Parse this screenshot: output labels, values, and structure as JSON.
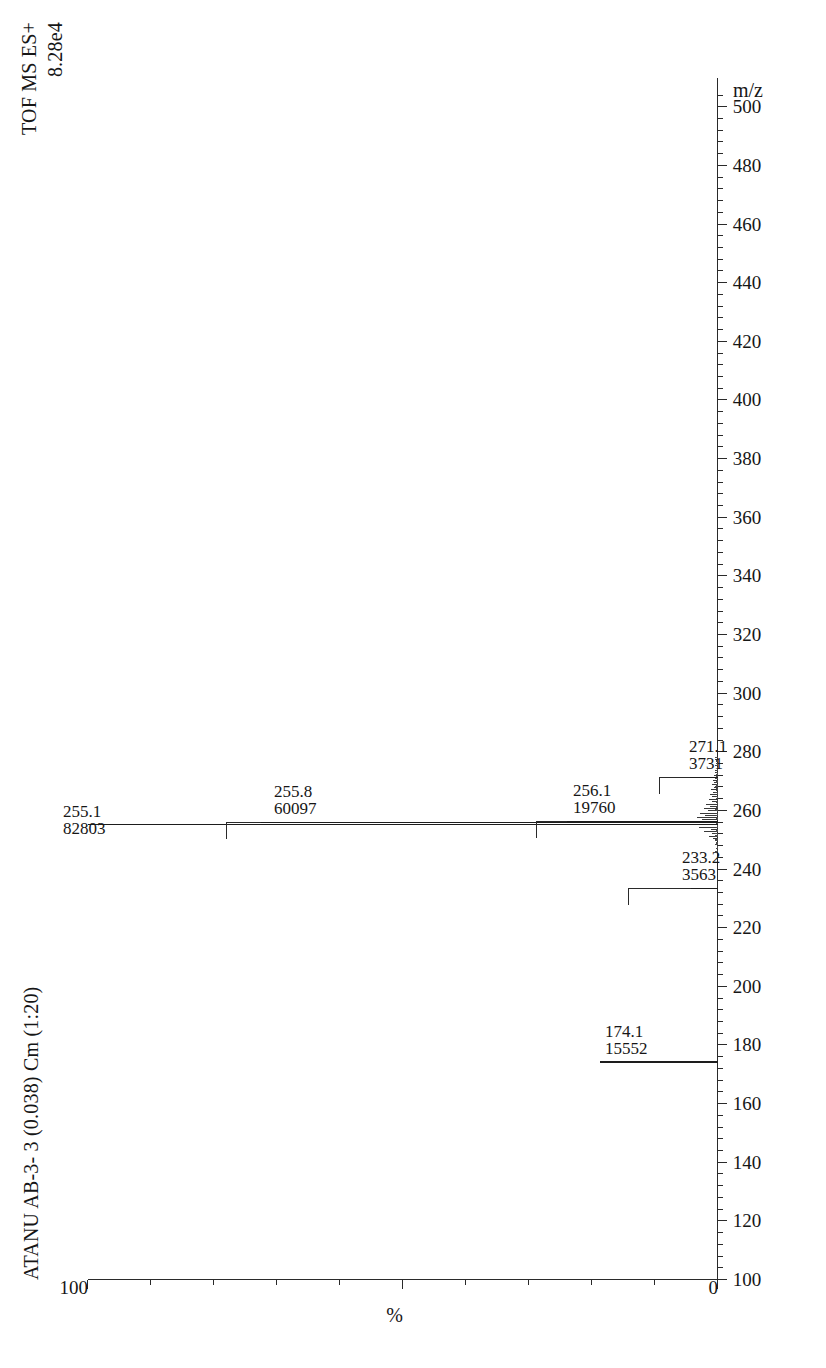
{
  "header": {
    "sample_title": "ATANU AB-3- 3 (0.038) Cm (1:20)",
    "ion_mode": "TOF MS ES+",
    "ion_intensity": "8.28e4"
  },
  "axes": {
    "x_title": "m/z",
    "y_title": "%",
    "y_max_label": "100",
    "y_min_label": "0",
    "x_tick_labels": [
      "100",
      "120",
      "140",
      "160",
      "180",
      "200",
      "220",
      "240",
      "260",
      "280",
      "300",
      "320",
      "340",
      "360",
      "380",
      "400",
      "420",
      "440",
      "460",
      "480",
      "500"
    ]
  },
  "chart_data": {
    "type": "bar",
    "title": "ATANU AB-3- 3 (0.038) Cm (1:20)",
    "subtitle": "TOF MS ES+  8.28e4",
    "xlabel": "m/z",
    "ylabel": "%",
    "xlim": [
      100,
      510
    ],
    "ylim": [
      0,
      100
    ],
    "grid": false,
    "legend": false,
    "base_peak_intensity": 82803,
    "labeled_peaks": [
      {
        "mz": 174.1,
        "abundance": 15552,
        "percent": 18.8,
        "label_mz": "174.1",
        "label_abundance": "15552"
      },
      {
        "mz": 233.2,
        "abundance": 3563,
        "percent": 4.3,
        "label_mz": "233.2",
        "label_abundance": "3563"
      },
      {
        "mz": 255.1,
        "abundance": 82803,
        "percent": 100.0,
        "label_mz": "255.1",
        "label_abundance": "82803"
      },
      {
        "mz": 255.8,
        "abundance": 60097,
        "percent": 72.6,
        "label_mz": "255.8",
        "label_abundance": "60097"
      },
      {
        "mz": 256.1,
        "abundance": 19760,
        "percent": 23.9,
        "label_mz": "256.1",
        "label_abundance": "19760"
      },
      {
        "mz": 271.1,
        "abundance": 3731,
        "percent": 4.5,
        "label_mz": "271.1",
        "label_abundance": "3731"
      }
    ],
    "baseline_noise_mz": [
      250.5,
      251.2,
      252.0,
      252.8,
      253.4,
      254.2,
      257.0,
      257.6,
      258.3,
      259.1,
      259.9,
      260.6,
      261.4,
      262.1,
      262.9,
      263.8,
      264.6,
      265.3,
      266.2,
      267.0,
      267.9,
      268.7,
      269.5,
      270.3,
      272.0,
      272.8,
      273.6
    ],
    "baseline_noise_percent": [
      0.8,
      1.4,
      0.9,
      2.2,
      1.1,
      3.0,
      2.6,
      3.4,
      2.0,
      2.9,
      1.6,
      2.3,
      1.2,
      1.9,
      1.0,
      1.5,
      0.9,
      1.3,
      0.8,
      1.1,
      0.7,
      0.9,
      0.6,
      0.8,
      0.7,
      0.5,
      0.4
    ]
  }
}
